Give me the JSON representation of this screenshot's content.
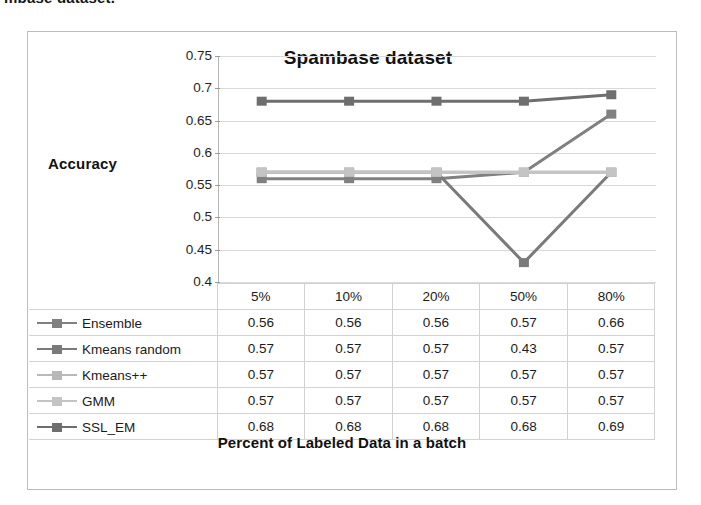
{
  "caption": {
    "text": "mbase dataset."
  },
  "chart_data": {
    "type": "line",
    "title": "Spambase dataset",
    "xlabel": "Percent of Labeled Data in a batch",
    "ylabel": "Accuracy",
    "categories": [
      "5%",
      "10%",
      "20%",
      "50%",
      "80%"
    ],
    "ylim": [
      0.4,
      0.75
    ],
    "ytick_labels": [
      "0.75",
      "0.7",
      "0.65",
      "0.6",
      "0.55",
      "0.5",
      "0.45",
      "0.4"
    ],
    "ytick_values": [
      0.75,
      0.7,
      0.65,
      0.6,
      0.55,
      0.5,
      0.45,
      0.4
    ],
    "grid": true,
    "legend_position": "table-left",
    "series": [
      {
        "name": "Ensemble",
        "values": [
          0.56,
          0.56,
          0.56,
          0.57,
          0.66
        ],
        "color": "#808080"
      },
      {
        "name": "Kmeans random",
        "values": [
          0.57,
          0.57,
          0.57,
          0.43,
          0.57
        ],
        "color": "#7a7a7a"
      },
      {
        "name": "Kmeans++",
        "values": [
          0.57,
          0.57,
          0.57,
          0.57,
          0.57
        ],
        "color": "#b8b8b8"
      },
      {
        "name": "GMM",
        "values": [
          0.57,
          0.57,
          0.57,
          0.57,
          0.57
        ],
        "color": "#c4c4c4"
      },
      {
        "name": "SSL_EM",
        "values": [
          0.68,
          0.68,
          0.68,
          0.68,
          0.69
        ],
        "color": "#6e6e6e"
      }
    ]
  },
  "table": {
    "header": [
      "",
      "5%",
      "10%",
      "20%",
      "50%",
      "80%"
    ],
    "rows": [
      {
        "label": "Ensemble",
        "values": [
          "0.56",
          "0.56",
          "0.56",
          "0.57",
          "0.66"
        ]
      },
      {
        "label": "Kmeans random",
        "values": [
          "0.57",
          "0.57",
          "0.57",
          "0.43",
          "0.57"
        ]
      },
      {
        "label": "Kmeans++",
        "values": [
          "0.57",
          "0.57",
          "0.57",
          "0.57",
          "0.57"
        ]
      },
      {
        "label": "GMM",
        "values": [
          "0.57",
          "0.57",
          "0.57",
          "0.57",
          "0.57"
        ]
      },
      {
        "label": "SSL_EM",
        "values": [
          "0.68",
          "0.68",
          "0.68",
          "0.68",
          "0.69"
        ]
      }
    ]
  },
  "colors": {
    "grid": "#d9d9d9",
    "frame": "#bdbdbd",
    "text": "#1c1c1c"
  }
}
